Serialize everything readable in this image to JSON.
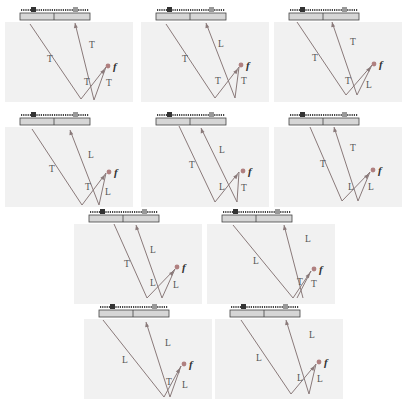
{
  "colors": {
    "background": "#ffffff",
    "region_fill": "#f1f1f1",
    "probe_fill": "#d6d6d6",
    "probe_stroke": "#444444",
    "ray_color": "#8a7a7a",
    "source_point": "#b08080",
    "label_color": "#555555"
  },
  "focus_label": "f",
  "panels": [
    {
      "id": 1,
      "labels": [
        "T",
        "T",
        "T",
        "T"
      ],
      "x": 3,
      "y": 5
    },
    {
      "id": 2,
      "labels": [
        "T",
        "L",
        "T",
        "T"
      ],
      "x": 139,
      "y": 5
    },
    {
      "id": 3,
      "labels": [
        "T",
        "T",
        "T",
        "L"
      ],
      "x": 272,
      "y": 5
    },
    {
      "id": 4,
      "labels": [
        "T",
        "L",
        "T",
        "L"
      ],
      "x": 3,
      "y": 110
    },
    {
      "id": 5,
      "labels": [
        "T",
        "L",
        "L",
        "T"
      ],
      "x": 139,
      "y": 110
    },
    {
      "id": 6,
      "labels": [
        "T",
        "T",
        "L",
        "L"
      ],
      "x": 272,
      "y": 110
    },
    {
      "id": 7,
      "labels": [
        "T",
        "L",
        "L",
        "L"
      ],
      "x": 72,
      "y": 207
    },
    {
      "id": 8,
      "labels": [
        "L",
        "L",
        "T",
        "T"
      ],
      "x": 205,
      "y": 207
    },
    {
      "id": 9,
      "labels": [
        "L",
        "L",
        "T",
        "L"
      ],
      "x": 82,
      "y": 302
    },
    {
      "id": 10,
      "labels": [
        "L",
        "L",
        "L",
        "L"
      ],
      "x": 213,
      "y": 302
    }
  ]
}
